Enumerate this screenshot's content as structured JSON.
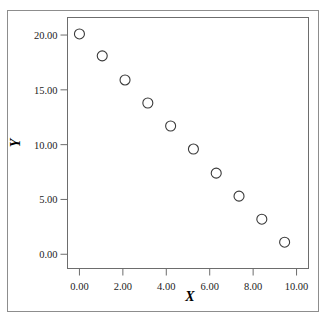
{
  "figure": {
    "caption_remnant": "",
    "background_color": "#ffffff",
    "border_color": "#8d8d8d"
  },
  "axes": {
    "x_title": "X",
    "y_title": "Y",
    "frame_color": "#6d6d6d"
  },
  "chart_data": {
    "type": "scatter",
    "title": "",
    "xlabel": "X",
    "ylabel": "Y",
    "xlim": [
      -0.55,
      10.55
    ],
    "ylim": [
      -1.3,
      21.6
    ],
    "xticks": [
      0,
      2,
      4,
      6,
      8,
      10
    ],
    "yticks": [
      0,
      5,
      10,
      15,
      20
    ],
    "xticklabels": [
      "0.00",
      "2.00",
      "4.00",
      "6.00",
      "8.00",
      "10.00"
    ],
    "yticklabels": [
      "0.00",
      "5.00",
      "10.00",
      "15.00",
      "20.00"
    ],
    "grid": false,
    "legend": false,
    "marker": "open-circle",
    "marker_color": "#3a3a3a",
    "marker_size": 5,
    "series": [
      {
        "name": "observations",
        "x": [
          0.0,
          1.05,
          2.1,
          3.15,
          4.2,
          5.25,
          6.3,
          7.35,
          8.4,
          9.45
        ],
        "y": [
          20.1,
          18.1,
          15.9,
          13.8,
          11.7,
          9.6,
          7.4,
          5.3,
          3.2,
          1.1
        ]
      }
    ]
  }
}
